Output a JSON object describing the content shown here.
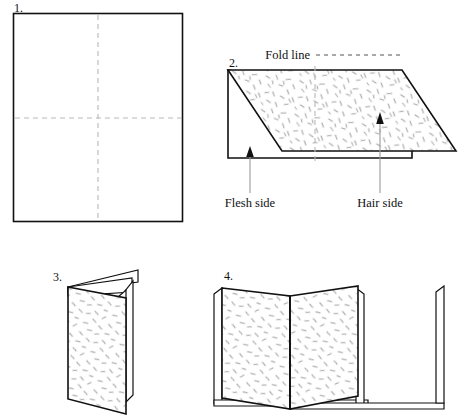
{
  "figure": {
    "title_present": false,
    "background_color": "#ffffff",
    "ink_color": "#111111",
    "fold_line_color": "#b9b9b9",
    "texture_color": "#a9a9a9"
  },
  "steps": [
    {
      "number": "1.",
      "name": "flat-sheet",
      "fold_lines": [
        "vertical-center",
        "horizontal-center"
      ]
    },
    {
      "number": "2.",
      "name": "folded-once-perspective",
      "fold_lines": [
        "vertical-center"
      ]
    },
    {
      "number": "3.",
      "name": "folded-booklet-closed"
    },
    {
      "number": "4.",
      "name": "folded-booklet-open"
    }
  ],
  "annotations": {
    "fold_line": "Fold line",
    "flesh_side": "Flesh side",
    "hair_side": "Hair side"
  }
}
